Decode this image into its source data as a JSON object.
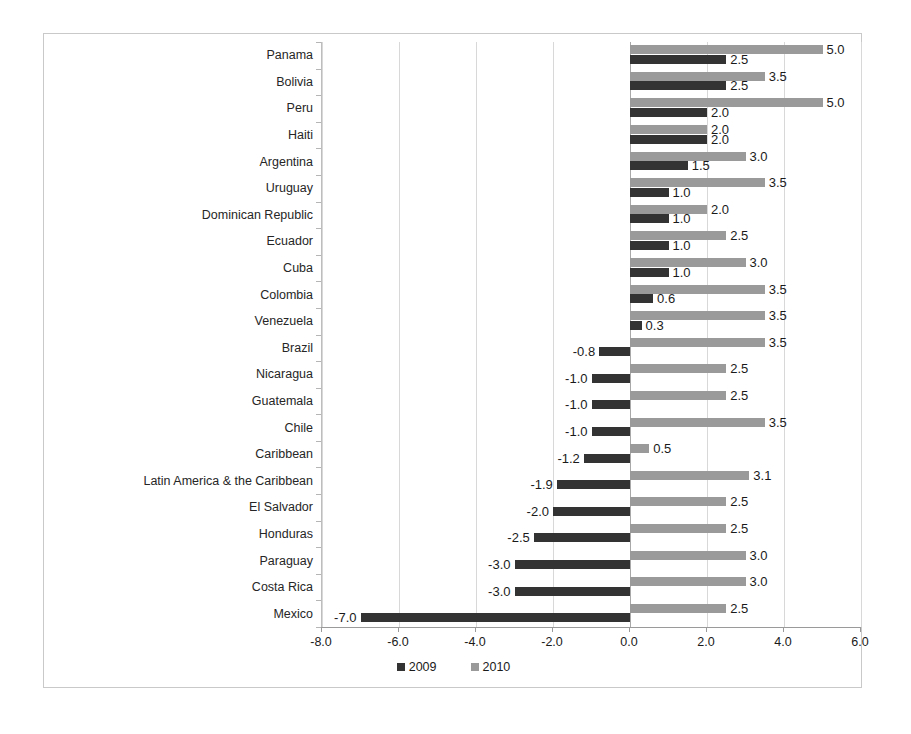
{
  "chart_data": {
    "type": "bar",
    "orientation": "horizontal",
    "title": "",
    "xlabel": "",
    "ylabel": "",
    "xlim": [
      -8.0,
      6.0
    ],
    "xticks": [
      "-8.0",
      "-6.0",
      "-4.0",
      "-2.0",
      "0.0",
      "2.0",
      "4.0",
      "6.0"
    ],
    "xtick_values": [
      -8.0,
      -6.0,
      -4.0,
      -2.0,
      0.0,
      2.0,
      4.0,
      6.0
    ],
    "grid": true,
    "legend_position": "bottom",
    "categories": [
      "Panama",
      "Bolivia",
      "Peru",
      "Haiti",
      "Argentina",
      "Uruguay",
      "Dominican Republic",
      "Ecuador",
      "Cuba",
      "Colombia",
      "Venezuela",
      "Brazil",
      "Nicaragua",
      "Guatemala",
      "Chile",
      "Caribbean",
      "Latin America & the Caribbean",
      "El Salvador",
      "Honduras",
      "Paraguay",
      "Costa Rica",
      "Mexico"
    ],
    "series": [
      {
        "name": "2009",
        "color": "#333333",
        "values": [
          2.5,
          2.5,
          2.0,
          2.0,
          1.5,
          1.0,
          1.0,
          1.0,
          1.0,
          0.6,
          0.3,
          -0.8,
          -1.0,
          -1.0,
          -1.0,
          -1.2,
          -1.9,
          -2.0,
          -2.5,
          -3.0,
          -3.0,
          -7.0
        ],
        "labels": [
          "2.5",
          "2.5",
          "2.0",
          "2.0",
          "1.5",
          "1.0",
          "1.0",
          "1.0",
          "1.0",
          "0.6",
          "0.3",
          "-0.8",
          "-1.0",
          "-1.0",
          "-1.0",
          "-1.2",
          "-1.9",
          "-2.0",
          "-2.5",
          "-3.0",
          "-3.0",
          "-7.0"
        ]
      },
      {
        "name": "2010",
        "color": "#9a9a9a",
        "values": [
          5.0,
          3.5,
          5.0,
          2.0,
          3.0,
          3.5,
          2.0,
          2.5,
          3.0,
          3.5,
          3.5,
          3.5,
          2.5,
          2.5,
          3.5,
          0.5,
          3.1,
          2.5,
          2.5,
          3.0,
          3.0,
          2.5
        ],
        "labels": [
          "5.0",
          "3.5",
          "5.0",
          "2.0",
          "3.0",
          "3.5",
          "2.0",
          "2.5",
          "3.0",
          "3.5",
          "3.5",
          "3.5",
          "2.5",
          "2.5",
          "3.5",
          "0.5",
          "3.1",
          "2.5",
          "2.5",
          "3.0",
          "3.0",
          "2.5"
        ]
      }
    ],
    "legend": [
      {
        "label": "2009",
        "color": "#333333"
      },
      {
        "label": "2010",
        "color": "#9a9a9a"
      }
    ]
  }
}
